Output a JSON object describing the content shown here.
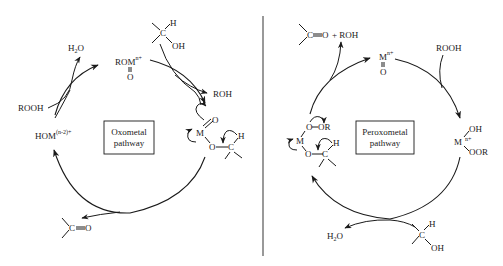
{
  "diagram": {
    "divider_color": "#555555",
    "left_cycle": {
      "box_label_line1": "Oxometal",
      "box_label_line2": "pathway",
      "species": {
        "water": "H",
        "water_sub": "2",
        "water_tail": "O",
        "rooh": "ROOH",
        "hom": "HOM",
        "hom_charge": "(n-2)+",
        "rom": "ROM",
        "rom_charge": "n+",
        "rom_oxo": "O",
        "alcohol_h": "H",
        "alcohol_c": "C",
        "alcohol_oh": "OH",
        "roh": "ROH",
        "intermediate_m": "M",
        "intermediate_o_top": "O",
        "intermediate_o": "O",
        "intermediate_c": "C",
        "intermediate_h": "H",
        "ketone_c": "C",
        "ketone_o": "O"
      }
    },
    "right_cycle": {
      "box_label_line1": "Peroxometal",
      "box_label_line2": "pathway",
      "species": {
        "ketone_c": "C",
        "ketone_o": "O",
        "plus_roh": "+ ROH",
        "m_oxo": "M",
        "m_oxo_charge": "n+",
        "m_oxo_o": "O",
        "rooh": "ROOH",
        "m_peroxo": "M",
        "m_peroxo_charge": "n+",
        "m_peroxo_oh": "OH",
        "m_peroxo_oor": "OOR",
        "alcohol_h": "H",
        "alcohol_c": "C",
        "alcohol_oh": "OH",
        "water": "H",
        "water_sub": "2",
        "water_tail": "O",
        "intermediate_o1": "O",
        "intermediate_or": "OR",
        "intermediate_m": "M",
        "intermediate_o2": "O",
        "intermediate_c": "C",
        "intermediate_h": "H"
      }
    }
  }
}
